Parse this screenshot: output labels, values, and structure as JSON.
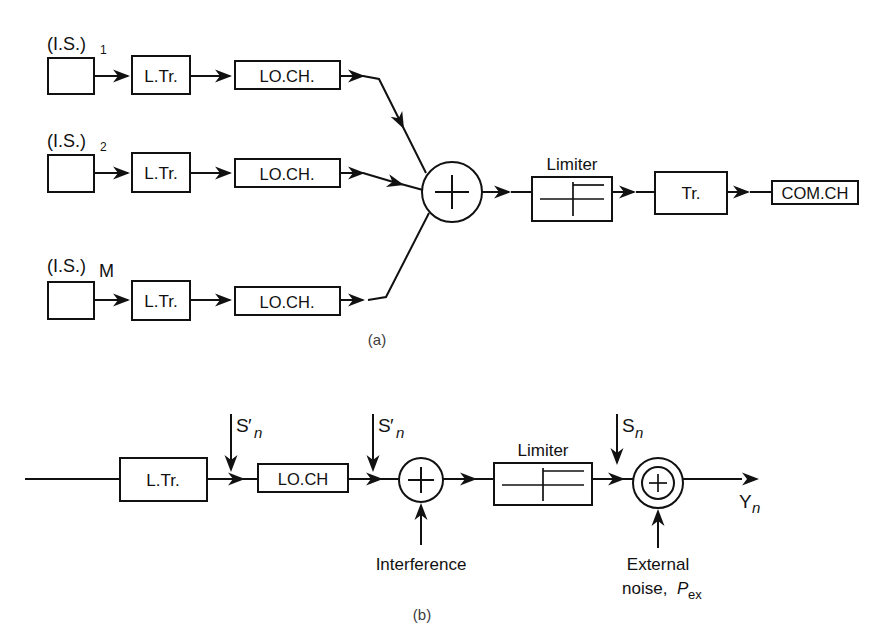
{
  "figure": {
    "caption_a": "(a)",
    "caption_b": "(b)"
  },
  "diagram_a": {
    "sources": [
      {
        "label": "(I.S.)",
        "subscript": "1"
      },
      {
        "label": "(I.S.)",
        "subscript": "2"
      },
      {
        "label": "(I.S.)",
        "subscript": "M"
      }
    ],
    "stage_translator": "L.Tr.",
    "stage_channel": "LO.CH.",
    "summer_symbol": "+",
    "limiter_label": "Limiter",
    "stage_transmitter": "Tr.",
    "output_label": "COM.CH"
  },
  "diagram_b": {
    "stage_translator": "L.Tr.",
    "stage_channel": "LO.CH",
    "limiter_label": "Limiter",
    "summer_symbol": "+",
    "adder_symbol": "+",
    "inputs": [
      {
        "base": "S",
        "prime": "′",
        "subscript": "n"
      },
      {
        "base": "S",
        "prime": "′",
        "subscript": "n"
      },
      {
        "base": "S",
        "prime": "",
        "subscript": "n"
      }
    ],
    "interference_label": "Interference",
    "external_noise_line1": "External",
    "external_noise_line2_prefix": "noise, ",
    "external_noise_symbol": "P",
    "external_noise_subscript": "ex",
    "output_base": "Y",
    "output_subscript": "n"
  },
  "colors": {
    "ink": "#111111",
    "paper": "#ffffff",
    "caption": "#3c3c3c"
  }
}
